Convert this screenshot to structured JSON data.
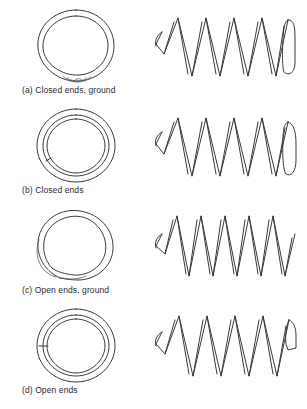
{
  "figure": {
    "background_color": "#ffffff",
    "line_color": "#3a3a3a",
    "views": [
      "end view",
      "side view"
    ],
    "variants": [
      {
        "key": "a",
        "caption": "(a) Closed ends, ground",
        "end_type": "closed and ground",
        "end_view_feature": "full circle with flattened tapered tail at bottom",
        "side_view_feature": "squared flat coils at both ends, 6 active coils",
        "coils": 6
      },
      {
        "key": "b",
        "caption": "(b) Closed ends",
        "end_type": "closed (squared) not ground",
        "end_view_feature": "two concentric circles with small radial break at lower left",
        "side_view_feature": "rounded closed coils at both ends, 6 active coils",
        "coils": 6
      },
      {
        "key": "c",
        "caption": "(c) Open ends, ground",
        "end_type": "open and ground",
        "end_view_feature": "spiral with overlapping tail at left side",
        "side_view_feature": "sharp angled open coil ends, 7 active coils",
        "coils": 7
      },
      {
        "key": "d",
        "caption": "(d) Open ends",
        "end_type": "open (plain) not ground",
        "end_view_feature": "two concentric circles with short radial tick at mid left",
        "side_view_feature": "angled open tail extending at right end, 6 active coils",
        "coils": 6
      }
    ]
  }
}
